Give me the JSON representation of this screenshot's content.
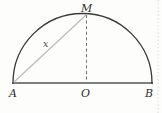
{
  "figure": {
    "background_color": "#fdfdfc",
    "width": 162,
    "height": 113,
    "labels": {
      "point_a": "A",
      "point_o": "O",
      "point_b": "B",
      "point_m": "M",
      "segment_am": "x"
    },
    "colors": {
      "arc": "#3a3a3a",
      "baseline": "#555555",
      "chord": "#b9b9b9",
      "dashed": "#6f6f6f",
      "page_edge_rule": "#d8d8d8",
      "label_text": "#2e2e2e"
    },
    "geometry": {
      "point_a": {
        "x": 13,
        "y": 83
      },
      "point_b": {
        "x": 152,
        "y": 83
      },
      "point_o": {
        "x": 86,
        "y": 83
      },
      "point_m": {
        "x": 86,
        "y": 15
      },
      "radius": 69.5,
      "arc_description": "semicircular arc from A to B above the diameter",
      "chord_description": "light gray segment from A to M labeled x",
      "dashed_description": "dashed vertical segment from M down to center O"
    },
    "edge_rule": {
      "name": "page-edge-dotted-rule",
      "x": 158,
      "y_start": 0,
      "y_end": 113
    }
  }
}
